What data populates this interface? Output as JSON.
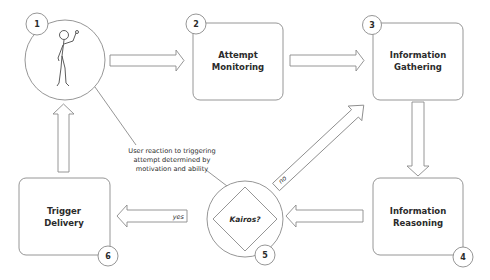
{
  "diagram": {
    "nodes": [
      {
        "id": 1,
        "number": "1",
        "type": "user-circle",
        "label": ""
      },
      {
        "id": 2,
        "number": "2",
        "type": "box",
        "label_lines": [
          "Attempt",
          "Monitoring"
        ]
      },
      {
        "id": 3,
        "number": "3",
        "type": "box",
        "label_lines": [
          "Information",
          "Gathering"
        ]
      },
      {
        "id": 4,
        "number": "4",
        "type": "box",
        "label_lines": [
          "Information",
          "Reasoning"
        ]
      },
      {
        "id": 5,
        "number": "5",
        "type": "decision",
        "label": "Kairos?"
      },
      {
        "id": 6,
        "number": "6",
        "type": "box",
        "label_lines": [
          "Trigger",
          "Delivery"
        ]
      }
    ],
    "edges": [
      {
        "from": 1,
        "to": 2,
        "label": ""
      },
      {
        "from": 2,
        "to": 3,
        "label": ""
      },
      {
        "from": 3,
        "to": 4,
        "label": ""
      },
      {
        "from": 4,
        "to": 5,
        "label": ""
      },
      {
        "from": 5,
        "to": 6,
        "label": "yes"
      },
      {
        "from": 5,
        "to": 3,
        "label": "no"
      },
      {
        "from": 6,
        "to": 1,
        "label": ""
      }
    ],
    "annotation": {
      "lines": [
        "User reaction to triggering",
        "attempt determined by",
        "motivation and ability"
      ]
    },
    "colors": {
      "stroke": "#8a8a8a",
      "text": "#2b2b2b",
      "background": "#ffffff"
    }
  }
}
